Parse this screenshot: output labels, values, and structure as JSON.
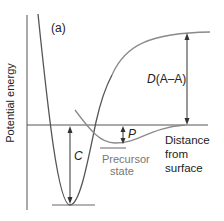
{
  "diagram": {
    "panel_label": "(a)",
    "y_axis_label": "Potential energy",
    "x_axis_label_lines": [
      "Distance",
      "from",
      "surface"
    ],
    "energy_labels": {
      "dissociation": {
        "symbol": "D",
        "suffix": "(A–A)"
      },
      "chemisorption": "C",
      "precursor": "P"
    },
    "precursor_label_lines": [
      "Precursor",
      "state"
    ],
    "colors": {
      "dark_curve": "#555555",
      "gray_curve": "#8a8a8a",
      "axis": "#555555",
      "text": "#222222",
      "gray_text": "#777777"
    }
  }
}
